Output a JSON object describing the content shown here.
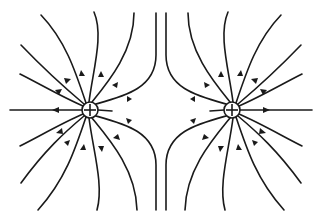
{
  "diagram": {
    "title": "Electric field lines of two equal positive point charges",
    "type": "field-lines",
    "line_color": "#1a1a1a",
    "background": "#ffffff",
    "charges": [
      {
        "id": "left",
        "sign": "+",
        "cx": 90,
        "cy": 110,
        "r": 8
      },
      {
        "id": "right",
        "sign": "+",
        "cx": 232,
        "cy": 110,
        "r": 8
      }
    ],
    "arrow_direction": "outward from charges"
  }
}
